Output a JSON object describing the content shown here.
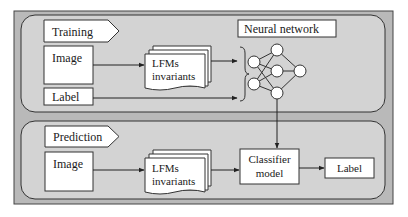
{
  "colors": {
    "outer_bg": "#b9b9b9",
    "panel_bg": "#d3d3d3",
    "box_fill": "#ffffff",
    "stroke": "#333333"
  },
  "training": {
    "tag": "Training",
    "image_label": "Image",
    "label_label": "Label",
    "features_line1": "LFMs",
    "features_line2": "invariants",
    "network_title": "Neural network"
  },
  "prediction": {
    "tag": "Prediction",
    "image_label": "Image",
    "features_line1": "LFMs",
    "features_line2": "invariants",
    "classifier_line1": "Classifier",
    "classifier_line2": "model",
    "output_label": "Label"
  }
}
